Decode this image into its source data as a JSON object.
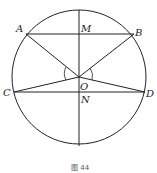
{
  "diagram": {
    "caption": "图 44",
    "circle": {
      "cx": 79,
      "cy": 77,
      "r": 67,
      "stroke": "#222222"
    },
    "points": {
      "A": {
        "label": "A",
        "x": 26,
        "y": 34
      },
      "B": {
        "label": "B",
        "x": 134,
        "y": 34
      },
      "M": {
        "label": "M",
        "x": 79,
        "y": 34
      },
      "O": {
        "label": "O",
        "x": 79,
        "y": 77
      },
      "C": {
        "label": "C",
        "x": 14,
        "y": 92
      },
      "D": {
        "label": "D",
        "x": 145,
        "y": 92
      },
      "N": {
        "label": "N",
        "x": 79,
        "y": 92
      }
    },
    "segments": [
      [
        "A",
        "B"
      ],
      [
        "C",
        "D"
      ],
      [
        "O",
        "A"
      ],
      [
        "O",
        "B"
      ],
      [
        "O",
        "C"
      ],
      [
        "O",
        "D"
      ]
    ],
    "diameter": {
      "x": 79,
      "y1": 10,
      "y2": 146
    },
    "angle_marks": [
      "angle-AOC",
      "angle-BOD"
    ]
  }
}
